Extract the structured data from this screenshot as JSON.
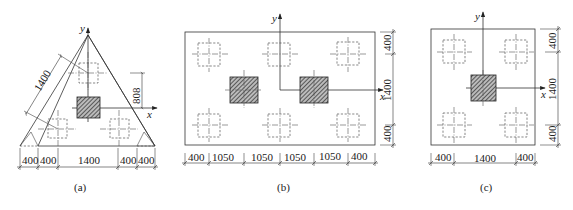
{
  "figure_a": {
    "caption": "(a)",
    "axis_x": "x",
    "axis_y": "y",
    "slant_dim": "1400",
    "vertical_dim": "808",
    "bottom_dims": [
      "400",
      "400",
      "1400",
      "400",
      "400"
    ]
  },
  "figure_b": {
    "caption": "(b)",
    "axis_x": "x",
    "axis_y": "y",
    "bottom_dims": [
      "400",
      "1050",
      "1050",
      "1050",
      "1050",
      "400"
    ],
    "right_dims": [
      "400",
      "1400",
      "400"
    ]
  },
  "figure_c": {
    "caption": "(c)",
    "axis_x": "x",
    "axis_y": "y",
    "bottom_dims": [
      "400",
      "1400",
      "400"
    ],
    "right_dims": [
      "400",
      "1400",
      "400"
    ]
  }
}
